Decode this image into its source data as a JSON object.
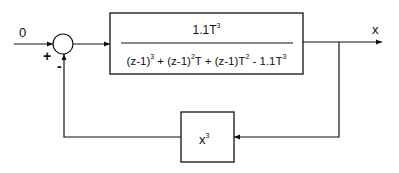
{
  "diagram": {
    "type": "feedback-block-diagram",
    "input": {
      "label": "0"
    },
    "summing_junction": {
      "plus_sign": "+",
      "minus_sign": "-"
    },
    "forward_block": {
      "numerator": {
        "coef": "1.1T",
        "exp": "3"
      },
      "denominator": {
        "t1": "(z-1)",
        "e1": "3",
        "t2": " + (z-1)",
        "e2": "2",
        "t3": "T + (z-1)T",
        "e3": "2",
        "t4": " - 1.1T",
        "e4": "3"
      }
    },
    "output": {
      "label": "x"
    },
    "feedback_block": {
      "base": "x",
      "exp": "3"
    }
  }
}
